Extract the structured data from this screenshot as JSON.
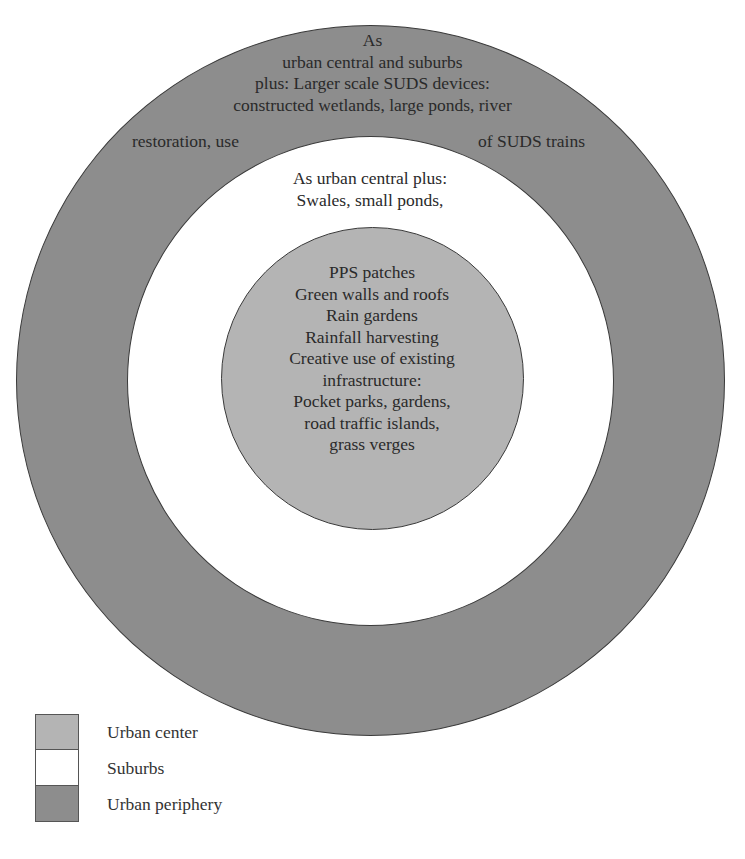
{
  "diagram": {
    "type": "concentric-circles",
    "colors": {
      "urban_center": "#b4b4b4",
      "suburbs": "#ffffff",
      "urban_periphery": "#8d8d8d",
      "outline": "#3a3a3a"
    },
    "rings": {
      "urban_periphery": {
        "lines": [
          "As",
          "urban central and suburbs",
          "plus: Larger scale SUDS devices:",
          "constructed wetlands, large ponds, river"
        ],
        "split_left": "restoration, use",
        "split_right": "of SUDS trains"
      },
      "suburbs": {
        "lines": [
          "As urban central plus:",
          "Swales, small ponds,"
        ]
      },
      "urban_center": {
        "lines": [
          "PPS patches",
          "Green walls and roofs",
          "Rain gardens",
          "Rainfall harvesting",
          "Creative use of existing",
          "infrastructure:",
          "Pocket parks, gardens,",
          "road traffic islands,",
          "grass verges"
        ]
      }
    },
    "legend": [
      {
        "label": "Urban center",
        "color": "#b4b4b4"
      },
      {
        "label": "Suburbs",
        "color": "#ffffff"
      },
      {
        "label": "Urban periphery",
        "color": "#8d8d8d"
      }
    ]
  }
}
